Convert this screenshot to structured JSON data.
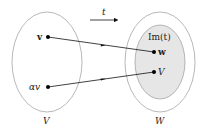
{
  "diagram": {
    "map_label": "t",
    "domain_set": {
      "label": "V"
    },
    "codomain_set": {
      "label": "W"
    },
    "image_set": {
      "label": "Im(t)",
      "fill": "#e6e6e6"
    },
    "points": [
      {
        "label": "v",
        "x": 48,
        "y": 37
      },
      {
        "label": "αv",
        "x": 48,
        "y": 87
      },
      {
        "label": "w",
        "x": 154,
        "y": 52
      },
      {
        "label": "V",
        "x": 154,
        "y": 72
      }
    ],
    "mappings": [
      {
        "from": "v",
        "to": "w"
      },
      {
        "from": "αv",
        "to": "V"
      }
    ],
    "colors": {
      "stroke": "#999999",
      "line": "#111111",
      "shade": "#e6e6e6"
    }
  }
}
